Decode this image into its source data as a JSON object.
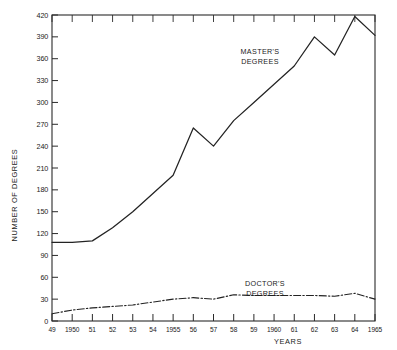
{
  "chart_data": {
    "type": "line",
    "title": "",
    "xlabel": "YEARS",
    "ylabel": "NUMBER OF DEGREES",
    "xlim": [
      1949,
      1965
    ],
    "ylim": [
      0,
      420
    ],
    "ytick_step": 30,
    "grid": false,
    "legend_position": "inline-annotations",
    "x": [
      1949,
      1950,
      1951,
      1952,
      1953,
      1954,
      1955,
      1956,
      1957,
      1958,
      1959,
      1960,
      1961,
      1962,
      1963,
      1964,
      1965
    ],
    "xtick_labels": [
      "49",
      "1950",
      "51",
      "52",
      "53",
      "54",
      "1955",
      "56",
      "57",
      "58",
      "59",
      "1960",
      "61",
      "62",
      "63",
      "64",
      "1965"
    ],
    "ytick_labels": [
      "0",
      "30",
      "60",
      "90",
      "120",
      "150",
      "180",
      "210",
      "240",
      "270",
      "300",
      "330",
      "360",
      "390",
      "420"
    ],
    "ytick_values": [
      0,
      30,
      60,
      90,
      120,
      150,
      180,
      210,
      240,
      270,
      300,
      330,
      360,
      390,
      420
    ],
    "series": [
      {
        "name": "MASTER'S DEGREES",
        "style": "solid",
        "color": "#232323",
        "annotation": "MASTER'S\nDEGREES",
        "annotation_line1": "MASTER'S",
        "annotation_line2": "DEGREES",
        "values": [
          108,
          108,
          110,
          128,
          150,
          175,
          200,
          265,
          240,
          275,
          300,
          325,
          350,
          390,
          365,
          418,
          392
        ]
      },
      {
        "name": "DOCTOR'S DEGREES",
        "style": "dash-dot",
        "color": "#232323",
        "annotation": "DOCTOR'S\nDEGREES",
        "annotation_line1": "DOCTOR'S",
        "annotation_line2": "DEGREES",
        "values": [
          10,
          15,
          18,
          20,
          22,
          26,
          30,
          32,
          30,
          36,
          35,
          35,
          35,
          35,
          34,
          38,
          30
        ]
      }
    ]
  }
}
